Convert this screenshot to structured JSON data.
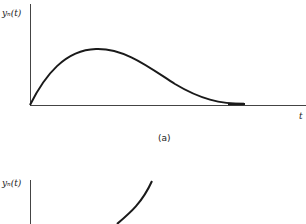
{
  "figure": {
    "panel_a": {
      "y_label": "yₙ(t)",
      "x_label": "t",
      "caption": "(a)",
      "curve": "rises from origin to a single peak, then decays to zero"
    },
    "panel_b": {
      "y_label": "yₙ(t)",
      "curve": "monotonically increasing, growing curve (partially visible)"
    },
    "colors": {
      "line": "#1a1a1a",
      "background": "#ffffff"
    }
  }
}
